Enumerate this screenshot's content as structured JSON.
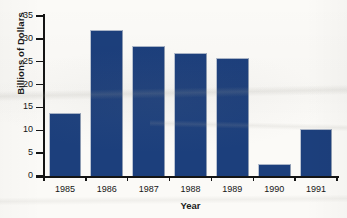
{
  "chart_data": {
    "type": "bar",
    "title": "",
    "subtitle": "",
    "xlabel": "Year",
    "ylabel": "Billions of Dollars",
    "categories": [
      "1985",
      "1986",
      "1987",
      "1988",
      "1989",
      "1990",
      "1991"
    ],
    "values": [
      13.8,
      31.9,
      28.5,
      26.8,
      25.8,
      2.6,
      10.2
    ],
    "ylim": [
      0,
      35
    ],
    "y_ticks": [
      0,
      5,
      10,
      15,
      20,
      25,
      30,
      35
    ],
    "y_tick_labels": [
      "0",
      "5",
      "10",
      "15",
      "20",
      "25",
      "30",
      "35"
    ],
    "grid": false,
    "legend": false,
    "legend_position": "none",
    "bar_color": "#1c3f7c",
    "axis_color": "#141414",
    "background_color": "#fbfaf7",
    "annotations": []
  },
  "axes": {
    "y_title": "Billions of Dollars",
    "x_title": "Year"
  }
}
